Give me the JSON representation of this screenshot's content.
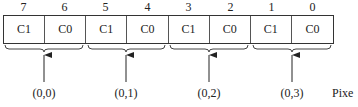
{
  "diagram": {
    "bit_indices": [
      "7",
      "6",
      "5",
      "4",
      "3",
      "2",
      "1",
      "0"
    ],
    "cells": [
      "C1",
      "C0",
      "C1",
      "C0",
      "C1",
      "C0",
      "C1",
      "C0"
    ],
    "pixel_coords": [
      "(0,0)",
      "(0,1)",
      "(0,2)",
      "(0,3)"
    ],
    "trailing_label": "Pixe",
    "colors": {
      "line": "#333333",
      "text": "#222222",
      "background": "#ffffff"
    }
  }
}
